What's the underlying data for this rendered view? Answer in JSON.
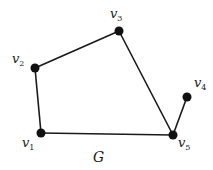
{
  "graph": {
    "title": "G",
    "nodes": [
      {
        "id": "v1",
        "base": "v",
        "sub": "1"
      },
      {
        "id": "v2",
        "base": "v",
        "sub": "2"
      },
      {
        "id": "v3",
        "base": "v",
        "sub": "3"
      },
      {
        "id": "v4",
        "base": "v",
        "sub": "4"
      },
      {
        "id": "v5",
        "base": "v",
        "sub": "5"
      }
    ],
    "edges": [
      [
        "v1",
        "v2"
      ],
      [
        "v2",
        "v3"
      ],
      [
        "v3",
        "v5"
      ],
      [
        "v1",
        "v5"
      ],
      [
        "v4",
        "v5"
      ]
    ]
  }
}
